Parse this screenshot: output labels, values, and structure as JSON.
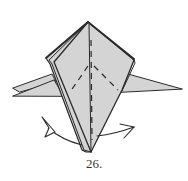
{
  "diagram": {
    "type": "origami-step",
    "step_label": "26.",
    "colors": {
      "paper_fill": "#d4d4d4",
      "line": "#2a2a2a",
      "background": "#ffffff"
    },
    "elements": [
      "folded-model-body",
      "left-wing-double-layer",
      "right-wing",
      "center-crease",
      "valley-fold-dashed-lines",
      "left-turn-arrow",
      "right-turn-arrow"
    ]
  }
}
